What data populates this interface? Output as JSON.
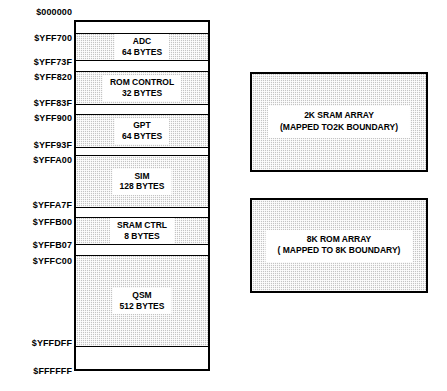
{
  "diagram": {
    "colors": {
      "shaded_fill": "#c4c4c4",
      "line": "#000000",
      "background": "#ffffff",
      "label_background": "#ffffff"
    }
  },
  "memory_map": {
    "address_labels": [
      {
        "text": "$000000",
        "top": 7
      },
      {
        "text": "$YFF700",
        "top": 33
      },
      {
        "text": "$YFF73F",
        "top": 57
      },
      {
        "text": "$YFF820",
        "top": 72
      },
      {
        "text": "$YFF83F",
        "top": 98
      },
      {
        "text": "$YFF900",
        "top": 113
      },
      {
        "text": "$YFF93F",
        "top": 140
      },
      {
        "text": "$YFFA00",
        "top": 155
      },
      {
        "text": "$YFFA7F",
        "top": 200
      },
      {
        "text": "$YFFB00",
        "top": 217
      },
      {
        "text": "$YFFB07",
        "top": 240
      },
      {
        "text": "$YFFC00",
        "top": 256
      },
      {
        "text": "$YFFDFF",
        "top": 338
      },
      {
        "text": "$FFFFFF",
        "top": 366
      }
    ],
    "bands": [
      {
        "name": "reserved-top",
        "shaded": false,
        "top": 0,
        "height": 11,
        "label": "",
        "sub": ""
      },
      {
        "name": "adc",
        "shaded": true,
        "top": 11,
        "height": 28,
        "label": "ADC",
        "sub": "64 BYTES"
      },
      {
        "name": "gap-1",
        "shaded": false,
        "top": 39,
        "height": 10,
        "label": "",
        "sub": ""
      },
      {
        "name": "rom-control",
        "shaded": true,
        "top": 49,
        "height": 34,
        "label": "ROM CONTROL",
        "sub": "32 BYTES"
      },
      {
        "name": "gap-2",
        "shaded": false,
        "top": 83,
        "height": 9,
        "label": "",
        "sub": ""
      },
      {
        "name": "gpt",
        "shaded": true,
        "top": 92,
        "height": 34,
        "label": "GPT",
        "sub": "64 BYTES"
      },
      {
        "name": "gap-3",
        "shaded": false,
        "top": 126,
        "height": 7,
        "label": "",
        "sub": ""
      },
      {
        "name": "sim",
        "shaded": true,
        "top": 133,
        "height": 53,
        "label": "SIM",
        "sub": "128 BYTES"
      },
      {
        "name": "gap-4",
        "shaded": false,
        "top": 186,
        "height": 9,
        "label": "",
        "sub": ""
      },
      {
        "name": "sram-ctrl",
        "shaded": true,
        "top": 195,
        "height": 28,
        "label": "SRAM CTRL",
        "sub": "8 BYTES"
      },
      {
        "name": "gap-5",
        "shaded": false,
        "top": 223,
        "height": 10,
        "label": "",
        "sub": ""
      },
      {
        "name": "qsm",
        "shaded": true,
        "top": 233,
        "height": 92,
        "label": "QSM",
        "sub": "512 BYTES"
      },
      {
        "name": "reserved-bottom",
        "shaded": false,
        "top": 325,
        "height": 22,
        "label": "",
        "sub": ""
      }
    ]
  },
  "arrays": [
    {
      "name": "sram-array",
      "line1": "2K SRAM ARRAY",
      "line2": "(MAPPED TO2K BOUNDARY)",
      "left": 250,
      "top": 72,
      "width": 178,
      "height": 100
    },
    {
      "name": "rom-array",
      "line1": "8K ROM ARRAY",
      "line2": "( MAPPED TO 8K BOUNDARY)",
      "left": 250,
      "top": 198,
      "width": 178,
      "height": 95
    }
  ]
}
